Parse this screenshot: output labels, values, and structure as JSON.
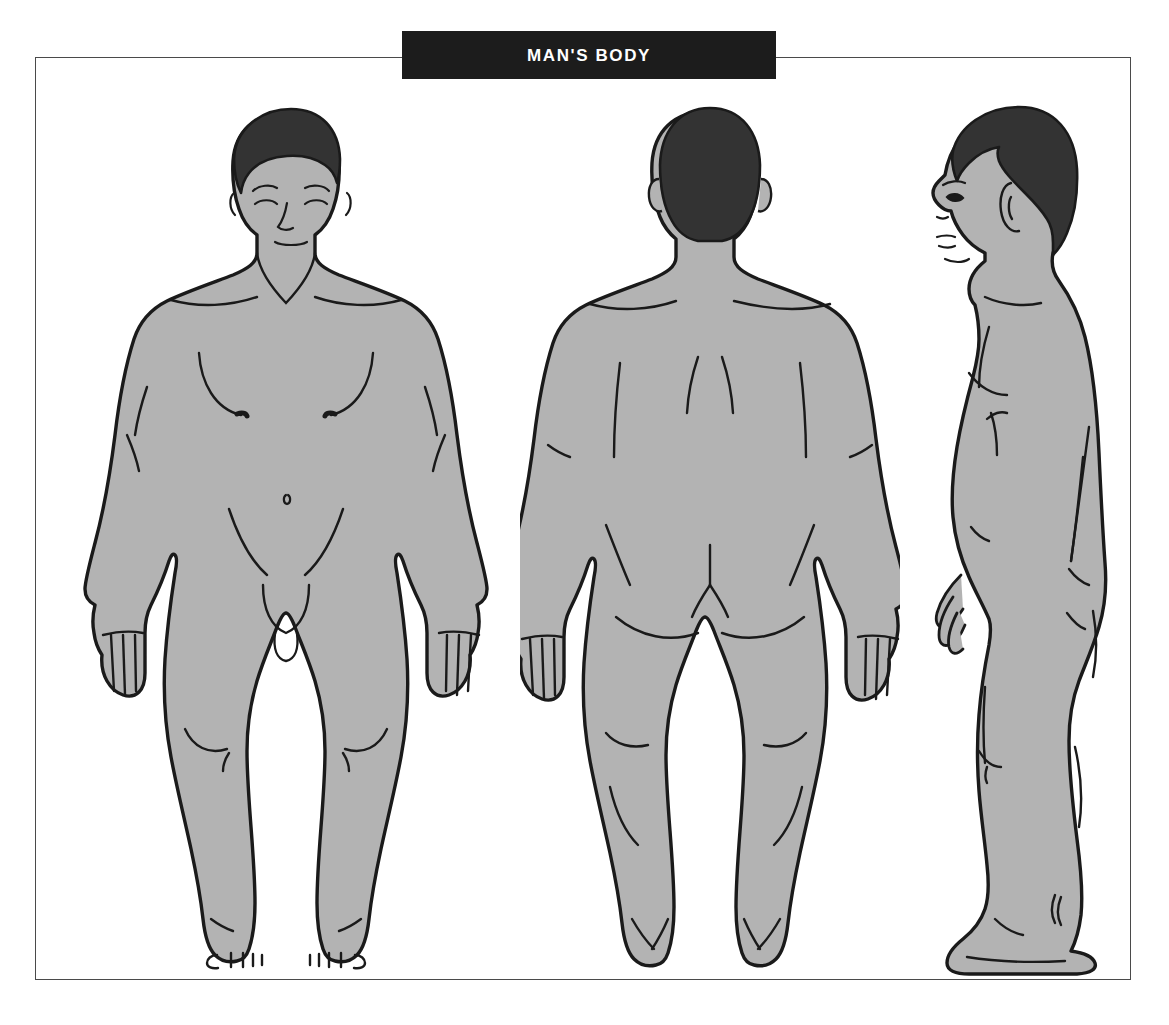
{
  "page": {
    "title": "MAN'S BODY",
    "background_color": "#ffffff"
  },
  "banner": {
    "label": "MAN'S BODY",
    "background_color": "#1c1c1c",
    "text_color": "#ffffff"
  },
  "frame": {
    "border_color": "#4a4a4a",
    "fill_color": "#ffffff"
  },
  "palette": {
    "skin_fill": "#b3b3b3",
    "outline": "#1a1a1a",
    "hair_fill": "#333333",
    "detail_line": "#1a1a1a"
  },
  "figures": [
    {
      "id": "front",
      "name": "Front view",
      "view": "anterior",
      "hair_color": "#333333",
      "body_color": "#b3b3b3",
      "features": [
        "head",
        "face",
        "eyes",
        "eyebrows",
        "nose",
        "mouth",
        "neck",
        "clavicle",
        "shoulders",
        "chest",
        "nipples",
        "navel",
        "arms",
        "hands",
        "fingers",
        "groin",
        "legs",
        "knees",
        "feet",
        "toes"
      ]
    },
    {
      "id": "back",
      "name": "Back view",
      "view": "posterior",
      "hair_color": "#333333",
      "body_color": "#b3b3b3",
      "features": [
        "head",
        "ears",
        "neck",
        "shoulder-blades",
        "spine",
        "back",
        "arms",
        "hands",
        "fingers",
        "buttocks",
        "legs",
        "calves",
        "heels"
      ]
    },
    {
      "id": "side",
      "name": "Side view",
      "view": "lateral",
      "hair_color": "#333333",
      "body_color": "#b3b3b3",
      "features": [
        "head",
        "profile-face",
        "eye",
        "nose",
        "lips",
        "chin",
        "ear",
        "neck",
        "chest",
        "back",
        "arm",
        "hand",
        "buttock",
        "thigh",
        "knee",
        "calf",
        "achilles",
        "foot"
      ]
    }
  ]
}
